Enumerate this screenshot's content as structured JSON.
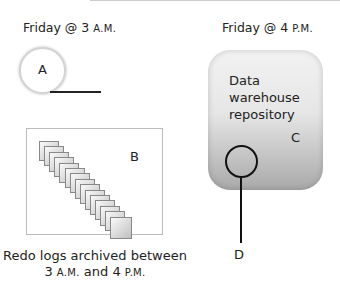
{
  "left_panel": {
    "title_main": "Friday @ 3 ",
    "title_suffix": "A.M.",
    "circle_label": "A",
    "box_label": "B",
    "caption_line1": "Redo logs archived between",
    "caption_line2_a": "3 ",
    "caption_line2_am": "A.M.",
    "caption_line2_mid": " and 4 ",
    "caption_line2_pm": "P.M.",
    "page_count": 15
  },
  "right_panel": {
    "title_main": "Friday @ 4 ",
    "title_suffix": "P.M.",
    "repository_line1": "Data",
    "repository_line2": "warehouse",
    "repository_line3": "repository",
    "repository_label": "C",
    "circle_label": "D"
  }
}
